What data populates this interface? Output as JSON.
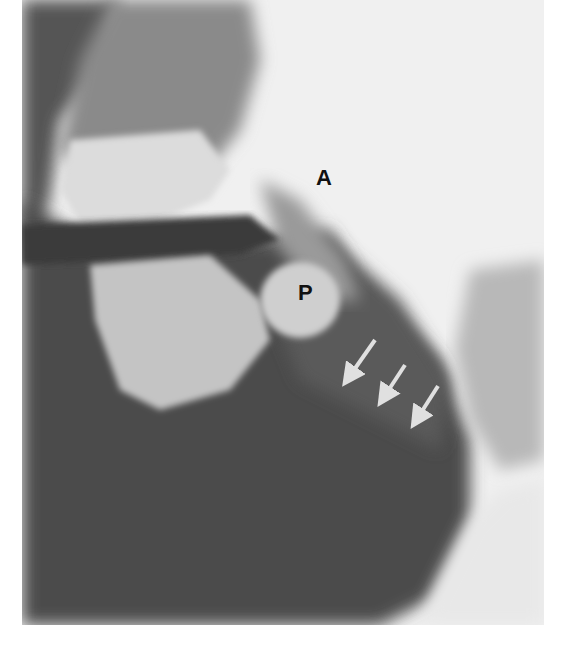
{
  "image": {
    "description": "Lateral soft-tissue radiograph of the neck and oral cavity",
    "labels": [
      {
        "text": "A",
        "x": 316,
        "y": 175
      },
      {
        "text": "P",
        "x": 298,
        "y": 290
      }
    ],
    "arrows": [
      {
        "x1": 375,
        "y1": 340,
        "x2": 345,
        "y2": 382
      },
      {
        "x1": 405,
        "y1": 365,
        "x2": 380,
        "y2": 402
      },
      {
        "x1": 438,
        "y1": 386,
        "x2": 413,
        "y2": 424
      }
    ],
    "colors": {
      "background": "#efefef",
      "dark": "#4a4a4a",
      "mid": "#7a7a7a",
      "bone": "#d8d8d8",
      "arrow": "#e0e0e0"
    }
  }
}
